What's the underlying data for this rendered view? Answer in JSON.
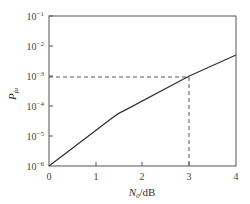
{
  "chart_data": {
    "type": "line",
    "title": "",
    "xlabel": "N0/dB",
    "xlabel_main": "N",
    "xlabel_sub": "0",
    "xlabel_unit": "/dB",
    "ylabel": "P_fa",
    "ylabel_main": "P",
    "ylabel_sub": "fa",
    "yscale": "log",
    "xlim": [
      0,
      4
    ],
    "ylim": [
      1e-06,
      0.1
    ],
    "x_ticks": [
      "0",
      "1",
      "2",
      "3",
      "4"
    ],
    "y_ticks": [
      {
        "base": "10",
        "exp": "−1",
        "value": 0.1
      },
      {
        "base": "10",
        "exp": "−2",
        "value": 0.01
      },
      {
        "base": "10",
        "exp": "−3",
        "value": 0.001
      },
      {
        "base": "10",
        "exp": "−4",
        "value": 0.0001
      },
      {
        "base": "10",
        "exp": "−5",
        "value": 1e-05
      },
      {
        "base": "10",
        "exp": "−6",
        "value": 1e-06
      }
    ],
    "grid": false,
    "legend": null,
    "series": [
      {
        "name": "P_fa vs N0",
        "x": [
          0,
          1.5,
          3,
          4
        ],
        "y": [
          1e-06,
          6e-05,
          0.001,
          0.005
        ],
        "style": "solid",
        "color": "#333333"
      }
    ],
    "annotations": [
      {
        "type": "dashed-reference",
        "x": 3,
        "y": 0.001,
        "description": "Dashed lines from y-axis at 10^-3 to curve and down to x=3"
      }
    ]
  }
}
